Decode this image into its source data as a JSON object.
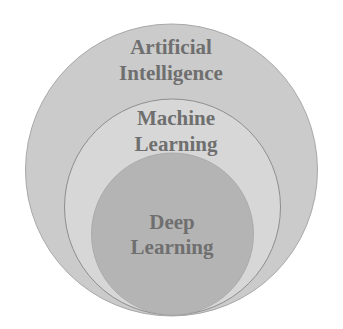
{
  "diagram": {
    "type": "nested-circles",
    "colors": {
      "background": "#ffffff",
      "outer_fill": "#cbcbcb",
      "middle_fill": "#d7d7d7",
      "inner_fill": "#b4b4b4",
      "stroke": "#9a9a9a",
      "text": "#6f6f6f"
    },
    "circles": [
      {
        "id": "ai",
        "label_line1": "Artificial",
        "label_line2": "Intelligence"
      },
      {
        "id": "ml",
        "label_line1": "Machine",
        "label_line2": "Learning"
      },
      {
        "id": "dl",
        "label_line1": "Deep",
        "label_line2": "Learning"
      }
    ]
  }
}
